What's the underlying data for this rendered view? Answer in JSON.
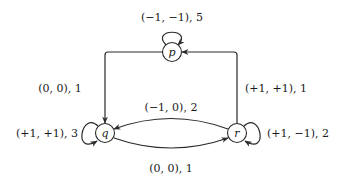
{
  "diagram": {
    "type": "state-transition-graph",
    "nodes": [
      {
        "id": "p",
        "label": "p",
        "x": 172,
        "y": 52
      },
      {
        "id": "q",
        "label": "q",
        "x": 105,
        "y": 133
      },
      {
        "id": "r",
        "label": "r",
        "x": 237,
        "y": 133
      }
    ],
    "edges": [
      {
        "from": "p",
        "to": "p",
        "label": "(−1, −1), 5"
      },
      {
        "from": "p",
        "to": "q",
        "label": "(0, 0), 1"
      },
      {
        "from": "r",
        "to": "p",
        "label": "(+1, +1), 1"
      },
      {
        "from": "r",
        "to": "q",
        "label": "(−1, 0), 2"
      },
      {
        "from": "q",
        "to": "r",
        "label": "(0, 0), 1"
      },
      {
        "from": "q",
        "to": "q",
        "label": "(+1, +1), 3"
      },
      {
        "from": "r",
        "to": "r",
        "label": "(+1, −1), 2"
      }
    ]
  },
  "labels": {
    "p_self": "(−1, −1), 5",
    "p_to_q": "(0, 0), 1",
    "r_to_p": "(+1, +1), 1",
    "r_to_q": "(−1, 0), 2",
    "q_to_r": "(0, 0), 1",
    "q_self": "(+1, +1), 3",
    "r_self": "(+1, −1), 2",
    "node_p": "p",
    "node_q": "q",
    "node_r": "r"
  }
}
